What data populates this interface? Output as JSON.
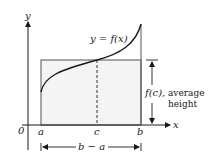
{
  "diagram": {
    "axes": {
      "x_label": "x",
      "y_label": "y",
      "origin_label": "0"
    },
    "points": {
      "a": "a",
      "c": "c",
      "b": "b"
    },
    "curve_label": "y = f(x)",
    "height_label_fc": "f(c),",
    "height_label_avg": "average",
    "height_label_h": "height",
    "width_label": "b − a",
    "colors": {
      "line": "#1a1a1a",
      "fill": "#f4f4f4"
    }
  }
}
